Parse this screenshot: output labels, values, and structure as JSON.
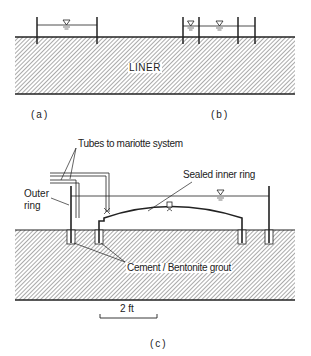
{
  "figure": {
    "panel_a": {
      "caption": "(a)"
    },
    "panel_b": {
      "caption": "(b)"
    },
    "panel_c": {
      "caption": "(c)"
    },
    "liner_label": "LINER",
    "labels": {
      "tubes": "Tubes to mariotte system",
      "sealed_inner_ring": "Sealed inner ring",
      "outer_ring_line1": "Outer",
      "outer_ring_line2": "ring",
      "grout": "Cement / Bentonite grout"
    },
    "scale_bar": {
      "label": "2 ft"
    },
    "colors": {
      "ink": "#222222",
      "hatch": "#555555",
      "background": "#ffffff"
    }
  }
}
